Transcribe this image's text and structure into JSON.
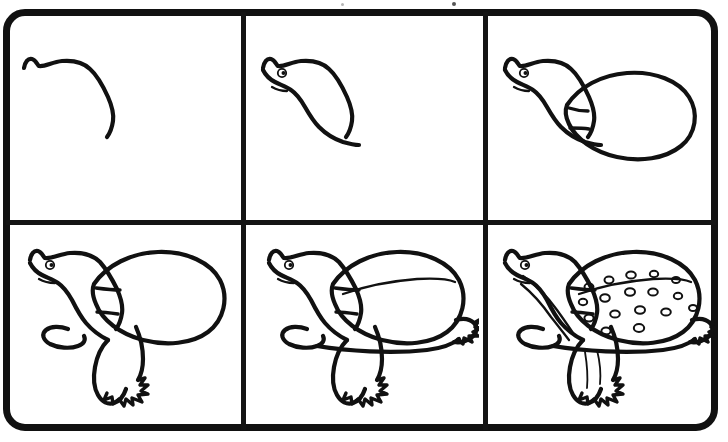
{
  "illustration": {
    "title": "How to Draw a Turtle",
    "subject": "turtle",
    "style": "black line art on white, step-by-step drawing tutorial",
    "layout": {
      "columns": 3,
      "rows": 2,
      "panel_count": 6,
      "frame_shape": "rounded-rectangle",
      "frame_color": "#111111",
      "background_color": "#ffffff",
      "line_color": "#111111"
    },
    "panels": [
      {
        "index": 1,
        "label": "step-1",
        "position": "top-left",
        "description": "A single gentle S-curve forming the top of the turtle's head and neck, with a small bump at the left for the snout."
      },
      {
        "index": 2,
        "label": "step-2",
        "position": "top-center",
        "description": "The head and neck outline is closed into a shape; a small round eye with a pupil and a short mouth line are added."
      },
      {
        "index": 3,
        "label": "step-3",
        "position": "top-right",
        "description": "A large egg-shaped oval is drawn behind the head to form the turtle's shell, joined to the neck with two small notch marks."
      },
      {
        "index": 4,
        "label": "step-4",
        "position": "bottom-left",
        "description": "The front leg and a clawed foot are added beneath the neck, plus a small rear flipper shape."
      },
      {
        "index": 5,
        "label": "step-5",
        "position": "bottom-center",
        "description": "The rear leg with claws is added at the right of the shell and a long ridge line is drawn across the top of the shell."
      },
      {
        "index": 6,
        "label": "step-6",
        "position": "bottom-right",
        "description": "Finished turtle: the shell is decorated with about seventeen small oval spots and the neck and legs get stripe details."
      }
    ]
  }
}
